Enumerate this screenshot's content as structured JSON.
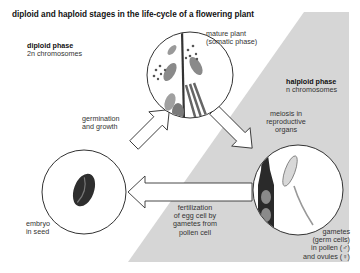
{
  "title": "diploid and haploid stages in the life-cycle of a flowering plant",
  "phases": {
    "diploid": {
      "name": "diploid phase",
      "detail": "2n chromosomes"
    },
    "haploid": {
      "name": "halploid phase",
      "detail": "n chromosomes"
    }
  },
  "stages": {
    "mature_plant": {
      "line1": "mature plant",
      "line2": "(somatic phase)"
    },
    "embryo": {
      "line1": "embryo",
      "line2": "in seed"
    },
    "gametes": {
      "line1": "gametes",
      "line2": "(germ cells)",
      "line3": "in pollen (♂)",
      "line4": "and ovules (♀)"
    }
  },
  "transitions": {
    "germination": {
      "line1": "germination",
      "line2": "and growth"
    },
    "meiosis": {
      "line1": "meiosis in",
      "line2": "reproductive",
      "line3": "organs"
    },
    "fertilization": {
      "line1": "fertilization",
      "line2": "of egg cell by",
      "line3": "gametes from",
      "line4": "pollen cell"
    }
  },
  "colors": {
    "haploid_region": "#d4d4d4",
    "outline": "#333333",
    "background": "#ffffff"
  }
}
